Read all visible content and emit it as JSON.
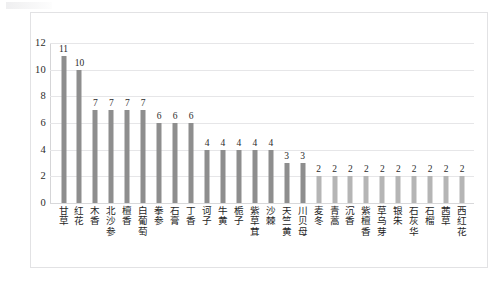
{
  "chart_data": {
    "type": "bar",
    "title": "",
    "subtitle": "",
    "xlabel": "",
    "ylabel": "",
    "ylim": [
      0,
      12
    ],
    "ytick_labels": [
      "12",
      "10",
      "8",
      "6",
      "4",
      "2",
      "0"
    ],
    "ytick_values": [
      12,
      10,
      8,
      6,
      4,
      2,
      0
    ],
    "grid": true,
    "legend": false,
    "legend_position": "none",
    "orientation": "vertical",
    "bar_color_dark": "#8e8e8e",
    "bar_color_light": "#b5b5b5",
    "gridline_color": "#e6e6e8",
    "axis_color": "#d5d5d7",
    "frame_color": "#e2e2e4",
    "background": "#ffffff",
    "categories": [
      "甘草",
      "红花",
      "木香",
      "北沙参",
      "檀香",
      "白葡萄",
      "拳参",
      "石膏",
      "丁香",
      "诃子",
      "牛黄",
      "栀子",
      "紫草茸",
      "沙棘",
      "天竺黄",
      "川贝母",
      "麦冬",
      "青蒿",
      "沉香",
      "紫檀香",
      "草乌芽",
      "银朱",
      "石灰华",
      "石榴",
      "茜草",
      "西红花"
    ],
    "values": [
      11,
      10,
      7,
      7,
      7,
      7,
      6,
      6,
      6,
      4,
      4,
      4,
      4,
      4,
      3,
      3,
      2,
      2,
      2,
      2,
      2,
      2,
      2,
      2,
      2,
      2
    ],
    "data_labels": [
      "11",
      "10",
      "7",
      "7",
      "7",
      "7",
      "6",
      "6",
      "6",
      "4",
      "4",
      "4",
      "4",
      "4",
      "3",
      "3",
      "2",
      "2",
      "2",
      "2",
      "2",
      "2",
      "2",
      "2",
      "2",
      "2"
    ]
  }
}
